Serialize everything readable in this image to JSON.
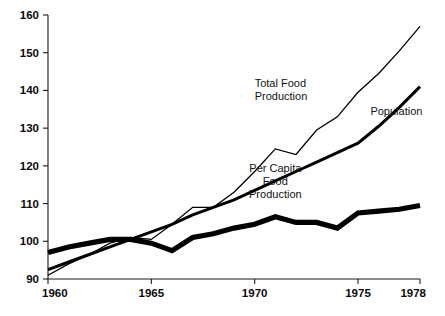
{
  "chart_data": {
    "type": "line",
    "title": "",
    "subtitle": "",
    "xlabel": "",
    "ylabel": "",
    "xlim": [
      1960,
      1978
    ],
    "ylim": [
      90,
      160
    ],
    "grid": false,
    "legend_position": "inline-annotations",
    "x": [
      1960,
      1961,
      1962,
      1963,
      1964,
      1965,
      1966,
      1967,
      1968,
      1969,
      1970,
      1971,
      1972,
      1973,
      1974,
      1975,
      1976,
      1977,
      1978
    ],
    "xticks": [
      1960,
      1965,
      1970,
      1975,
      1978
    ],
    "xticklabels": [
      "1960",
      "1965",
      "1970",
      "1975",
      "1978"
    ],
    "yticks": [
      90,
      100,
      110,
      120,
      130,
      140,
      150,
      160
    ],
    "yticklabels": [
      "90",
      "100",
      "110",
      "120",
      "130",
      "140",
      "150",
      "160"
    ],
    "series": [
      {
        "name": "Total Food Production",
        "style": "thin",
        "label_lines": [
          "Total Food",
          "Production"
        ],
        "values": [
          91.0,
          94.0,
          96.5,
          99.5,
          101.0,
          100.5,
          104.5,
          109.0,
          109.0,
          113.0,
          118.5,
          124.5,
          123.0,
          129.5,
          133.0,
          139.5,
          144.5,
          150.5,
          157.0
        ]
      },
      {
        "name": "Population",
        "style": "medium",
        "label_lines": [
          "Population"
        ],
        "values": [
          92.5,
          94.5,
          96.5,
          98.5,
          100.5,
          102.5,
          104.5,
          107.0,
          109.0,
          111.0,
          113.5,
          116.0,
          118.5,
          121.0,
          123.5,
          126.0,
          130.5,
          135.5,
          141.0
        ]
      },
      {
        "name": "Per Capita Food Production",
        "style": "thick",
        "label_lines": [
          "Per Capita",
          "Food",
          "Production"
        ],
        "values": [
          97.0,
          98.5,
          99.5,
          100.5,
          100.5,
          99.5,
          97.5,
          101.0,
          102.0,
          103.5,
          104.5,
          106.5,
          105.0,
          105.0,
          103.5,
          107.5,
          108.0,
          108.5,
          109.5
        ]
      }
    ],
    "annotations": [
      {
        "text_lines": [
          "Total Food",
          "Production"
        ],
        "x": 1970.0,
        "y": 141.0,
        "anchor": "start"
      },
      {
        "text_lines": [
          "Population"
        ],
        "x": 1975.6,
        "y": 133.5,
        "anchor": "start"
      },
      {
        "text_lines": [
          "Per Capita",
          "Food",
          "Production"
        ],
        "x": 1971.0,
        "y": 118.5,
        "anchor": "middle"
      }
    ],
    "colors": {
      "axis": "#1a1a1a",
      "line": "#000000",
      "background": "#ffffff",
      "text": "#111111"
    }
  }
}
